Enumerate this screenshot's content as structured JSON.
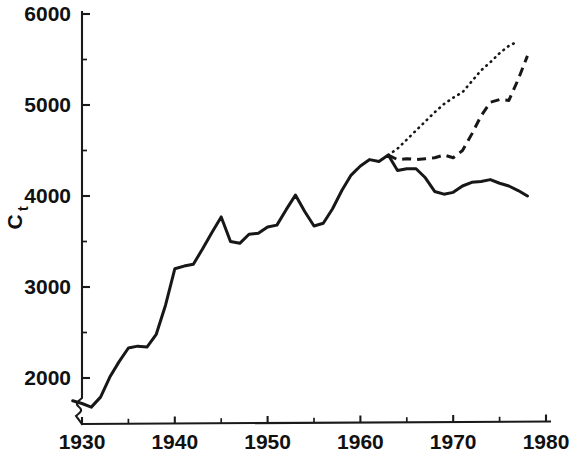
{
  "chart_data": {
    "type": "line",
    "title": "",
    "subtitle": "",
    "xlabel": "",
    "ylabel": "Ct",
    "ylabel_base": "C",
    "ylabel_sub": "t",
    "xlim": [
      1927,
      1980
    ],
    "ylim": [
      1600,
      6000
    ],
    "grid": false,
    "legend": "none",
    "y_ticks_major": [
      2000,
      3000,
      4000,
      5000,
      6000
    ],
    "y_ticks_minor": [
      2500,
      3500,
      4500,
      5500
    ],
    "y_tick_labels": [
      "2000",
      "3000",
      "4000",
      "5000",
      "6000"
    ],
    "x_ticks_major": [
      1930,
      1940,
      1950,
      1960,
      1970,
      1980
    ],
    "x_ticks_minor": [
      1935,
      1945,
      1955,
      1965,
      1975
    ],
    "x_tick_labels": [
      "1930",
      "1940",
      "1950",
      "1960",
      "1970",
      "1980"
    ],
    "axis_break_y": true,
    "colors": {
      "axis": "#1a1a1a",
      "series": "#171717",
      "background": "#ffffff"
    },
    "series": [
      {
        "name": "solid",
        "style": "solid",
        "x": [
          1929,
          1930,
          1931,
          1932,
          1933,
          1934,
          1935,
          1936,
          1937,
          1938,
          1939,
          1940,
          1941,
          1942,
          1943,
          1944,
          1945,
          1946,
          1947,
          1948,
          1949,
          1950,
          1951,
          1952,
          1953,
          1954,
          1955,
          1956,
          1957,
          1958,
          1959,
          1960,
          1961,
          1962,
          1963,
          1964,
          1965,
          1966,
          1967,
          1968,
          1969,
          1970,
          1971,
          1972,
          1973,
          1974,
          1975,
          1976,
          1977,
          1978
        ],
        "y": [
          1750,
          1720,
          1680,
          1790,
          2010,
          2180,
          2330,
          2350,
          2340,
          2480,
          2800,
          3200,
          3230,
          3250,
          3420,
          3600,
          3770,
          3500,
          3480,
          3580,
          3590,
          3660,
          3680,
          3850,
          4010,
          3830,
          3670,
          3700,
          3860,
          4060,
          4230,
          4330,
          4400,
          4380,
          4450,
          4280,
          4300,
          4300,
          4200,
          4050,
          4020,
          4040,
          4110,
          4150,
          4160,
          4180,
          4140,
          4110,
          4060,
          4000
        ]
      },
      {
        "name": "dashed",
        "style": "dashed",
        "x": [
          1963,
          1964,
          1965,
          1966,
          1967,
          1968,
          1969,
          1970,
          1971,
          1972,
          1973,
          1974,
          1975,
          1976,
          1977,
          1978
        ],
        "y": [
          4450,
          4400,
          4410,
          4400,
          4410,
          4420,
          4450,
          4420,
          4500,
          4680,
          4880,
          5030,
          5060,
          5050,
          5280,
          5540
        ]
      },
      {
        "name": "dotted",
        "style": "dotted",
        "x": [
          1963,
          1964,
          1965,
          1966,
          1967,
          1968,
          1969,
          1970,
          1971,
          1972,
          1973,
          1974,
          1975,
          1976,
          1977
        ],
        "y": [
          4450,
          4520,
          4620,
          4720,
          4820,
          4920,
          5010,
          5080,
          5140,
          5260,
          5380,
          5470,
          5570,
          5650,
          5700
        ]
      }
    ]
  }
}
